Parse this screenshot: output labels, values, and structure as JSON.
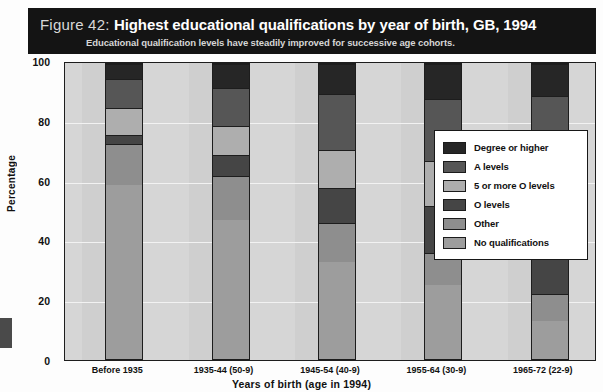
{
  "figure": {
    "number_label": "Figure 42:",
    "title": "Highest educational qualifications by year of birth, GB, 1994",
    "subtitle": "Educational qualification levels have steadily improved for successive age cohorts."
  },
  "colors": {
    "banner_background": "#141414",
    "plot_background": "#d6d6d6",
    "plot_band": "#cfcfcf",
    "gridline": "#f2f2f2",
    "axis": "#1d1d1d",
    "legend_background": "#ffffff",
    "legend_border": "#171717",
    "degree_or_higher": "#262626",
    "a_levels": "#565656",
    "five_or_more_o_levels": "#aeaeae",
    "o_levels": "#454545",
    "other": "#8e8e8e",
    "no_qualifications": "#9d9d9d"
  },
  "chart_data": {
    "type": "bar",
    "subtype": "stacked-bar-100",
    "title": "Highest educational qualifications by year of birth, GB, 1994",
    "subtitle": "Educational qualification levels have steadily improved for successive age cohorts.",
    "xlabel": "Years of birth (age in 1994)",
    "ylabel": "Percentage",
    "ylim": [
      0,
      100
    ],
    "yticks": [
      0,
      20,
      40,
      60,
      80,
      100
    ],
    "grid": true,
    "legend_position": "right-inside",
    "categories": [
      "Before 1935",
      "1935-44 (50-9)",
      "1945-54 (40-9)",
      "1955-64 (30-9)",
      "1965-72 (22-9)"
    ],
    "series": [
      {
        "name": "No qualifications",
        "color": "#9d9d9d",
        "values": [
          59,
          47,
          33,
          25,
          13
        ]
      },
      {
        "name": "Other",
        "color": "#8e8e8e",
        "values": [
          14,
          15,
          13,
          11,
          9
        ]
      },
      {
        "name": "O levels",
        "color": "#454545",
        "values": [
          3,
          7,
          12,
          16,
          22
        ]
      },
      {
        "name": "5 or more O levels",
        "color": "#aeaeae",
        "values": [
          9,
          10,
          13,
          15,
          19
        ]
      },
      {
        "name": "A levels",
        "color": "#565656",
        "values": [
          10,
          13,
          19,
          21,
          26
        ]
      },
      {
        "name": "Degree or higher",
        "color": "#262626",
        "values": [
          5,
          8,
          10,
          12,
          11
        ]
      }
    ]
  },
  "legend": {
    "entries": [
      {
        "label": "Degree or higher",
        "color": "#262626"
      },
      {
        "label": "A levels",
        "color": "#565656"
      },
      {
        "label": "5 or more O levels",
        "color": "#aeaeae"
      },
      {
        "label": "O levels",
        "color": "#454545"
      },
      {
        "label": "Other",
        "color": "#8e8e8e"
      },
      {
        "label": "No qualifications",
        "color": "#9d9d9d"
      }
    ]
  }
}
